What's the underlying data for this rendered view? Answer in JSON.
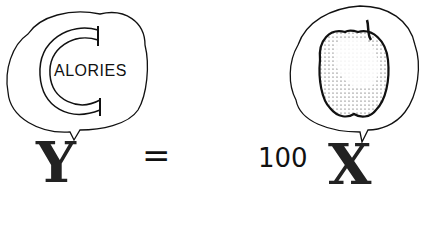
{
  "equation": {
    "left_variable": "Y",
    "equals_sign": "=",
    "coefficient": "100",
    "right_variable": "X"
  },
  "left_bubble": {
    "big_letter": "C",
    "text": "ALORIES",
    "concept": "calories"
  },
  "right_bubble": {
    "icon": "apple-icon",
    "concept": "apple"
  },
  "colors": {
    "ink": "#111111",
    "background": "#ffffff"
  }
}
